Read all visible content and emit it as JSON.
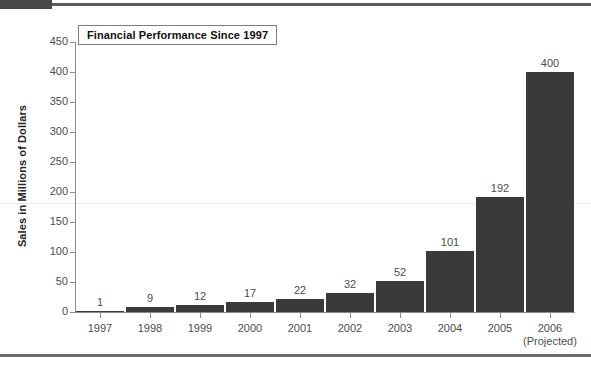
{
  "page": {
    "header_block_name": "document-header-block",
    "accent_color": "#4a4a4a"
  },
  "chart_data": {
    "type": "bar",
    "title": "Financial Performance Since 1997",
    "xlabel": "",
    "ylabel": "Sales in Millions of Dollars",
    "categories": [
      "1997",
      "1998",
      "1999",
      "2000",
      "2001",
      "2002",
      "2003",
      "2004",
      "2005",
      "2006"
    ],
    "category_sublabels": [
      "",
      "",
      "",
      "",
      "",
      "",
      "",
      "",
      "",
      "(Projected)"
    ],
    "values": [
      1,
      9,
      12,
      17,
      22,
      32,
      52,
      101,
      192,
      400
    ],
    "value_labels": [
      "1",
      "9",
      "12",
      "17",
      "22",
      "32",
      "52",
      "101",
      "192",
      "400"
    ],
    "ylim": [
      0,
      450
    ],
    "ytick_values": [
      0,
      50,
      100,
      150,
      200,
      250,
      300,
      350,
      400,
      450
    ],
    "ytick_labels": [
      "0",
      "50",
      "100",
      "150",
      "200",
      "250",
      "300",
      "350",
      "400",
      "450"
    ],
    "grid": false,
    "legend": null,
    "bar_color": "#3a3a3a",
    "axis_color": "#8c8c8c",
    "series": [
      {
        "name": "Sales",
        "values": [
          1,
          9,
          12,
          17,
          22,
          32,
          52,
          101,
          192,
          400
        ]
      }
    ]
  }
}
